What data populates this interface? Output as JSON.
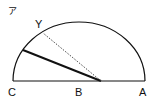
{
  "figure_label": "ア",
  "points": {
    "C": "C",
    "B": "B",
    "A": "A",
    "Y": "Y"
  }
}
